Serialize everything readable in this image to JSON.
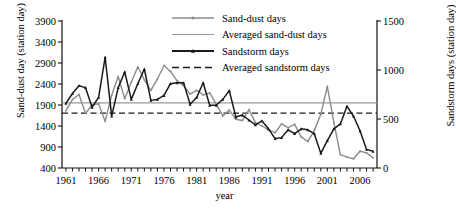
{
  "chart_data": {
    "type": "line",
    "title": "",
    "xlabel": "year",
    "ylabel": "Sand-dust day (station day)",
    "ylabel_right": "Sandstorm days (station day)",
    "xlim": [
      1960.4,
      2008.6
    ],
    "ylim": [
      400,
      3900
    ],
    "ylim_right": [
      0,
      1500
    ],
    "grid": false,
    "legend_position": "top-center",
    "xticks": [
      1961,
      1966,
      1971,
      1976,
      1981,
      1986,
      1991,
      1996,
      2001,
      2006
    ],
    "xtick_labels": [
      "1961",
      "1966",
      "1971",
      "1976",
      "1981",
      "1986",
      "1991",
      "1996",
      "2001",
      "2006"
    ],
    "yticks": [
      400,
      900,
      1400,
      1900,
      2400,
      2900,
      3400,
      3900
    ],
    "ytick_labels": [
      "400",
      "900",
      "1400",
      "1900",
      "2400",
      "2900",
      "3400",
      "3900"
    ],
    "yticks_right": [
      0,
      500,
      1000,
      1500
    ],
    "ytick_labels_right": [
      "0",
      "500",
      "1000",
      "1500"
    ],
    "x": [
      1961,
      1962,
      1963,
      1964,
      1965,
      1966,
      1967,
      1968,
      1969,
      1970,
      1971,
      1972,
      1973,
      1974,
      1975,
      1976,
      1977,
      1978,
      1979,
      1980,
      1981,
      1982,
      1983,
      1984,
      1985,
      1986,
      1987,
      1988,
      1989,
      1990,
      1991,
      1992,
      1993,
      1994,
      1995,
      1996,
      1997,
      1998,
      1999,
      2000,
      2001,
      2002,
      2003,
      2004,
      2005,
      2006,
      2007,
      2008
    ],
    "series": [
      {
        "name": "Sand-dust days",
        "axis": "left",
        "color": "#8c8c8c",
        "marker": "circle",
        "values": [
          1760,
          2030,
          2150,
          1700,
          1900,
          1930,
          1510,
          2130,
          2580,
          2050,
          2440,
          2810,
          2500,
          2250,
          2520,
          2840,
          2700,
          2480,
          2360,
          2160,
          2250,
          2140,
          2190,
          1920,
          1640,
          1780,
          1560,
          1530,
          1790,
          1480,
          1400,
          1310,
          1240,
          1450,
          1360,
          1440,
          1140,
          1030,
          1290,
          1680,
          2340,
          1480,
          720,
          660,
          620,
          800,
          760,
          640
        ]
      },
      {
        "name": "Averaged sand-dust days",
        "axis": "left",
        "color": "#9a9a9a",
        "style": "solid-flat",
        "value": 1950
      },
      {
        "name": "Sandstorm days",
        "axis": "right",
        "color": "#1a1a1a",
        "marker": "triangle",
        "values": [
          660,
          760,
          840,
          820,
          620,
          720,
          1130,
          530,
          820,
          980,
          700,
          860,
          1010,
          690,
          700,
          740,
          860,
          870,
          870,
          650,
          720,
          870,
          640,
          640,
          700,
          790,
          520,
          540,
          490,
          440,
          480,
          400,
          300,
          310,
          390,
          350,
          400,
          390,
          350,
          150,
          280,
          400,
          450,
          630,
          530,
          380,
          190,
          170
        ]
      },
      {
        "name": "Averaged sandstorm days",
        "axis": "right",
        "color": "#1a1a1a",
        "style": "dashed-flat",
        "value": 560
      }
    ]
  },
  "legend": {
    "items": [
      {
        "label": "Sand-dust days",
        "style": "gray-line-marker"
      },
      {
        "label": "Averaged sand-dust days",
        "style": "gray-line"
      },
      {
        "label": "Sandstorm days",
        "style": "black-line-marker"
      },
      {
        "label": "Averaged sandstorm days",
        "style": "black-dashed"
      }
    ]
  },
  "axis_titles": {
    "left": "Sand-dust day (station day)",
    "right": "Sandstorm days (station day)",
    "bottom": "year"
  }
}
